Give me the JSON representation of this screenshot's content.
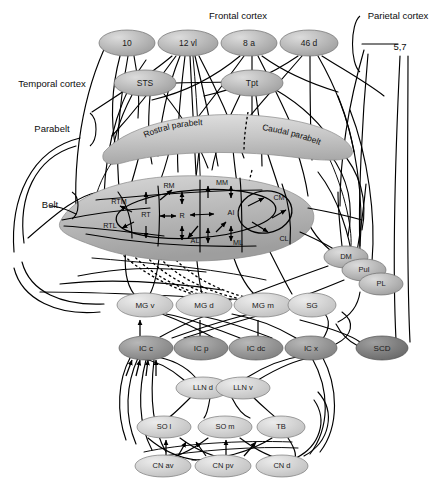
{
  "figure": {
    "type": "connectivity-diagram"
  },
  "region_labels": {
    "frontal_cortex": "Frontal cortex",
    "parietal_cortex": "Parietal cortex",
    "temporal_cortex": "Temporal cortex",
    "parabelt": "Parabelt",
    "belt": "Belt",
    "parietal_area": "5,7"
  },
  "nodes": {
    "frontal": [
      {
        "id": "a10",
        "label": "10",
        "cx": 127,
        "cy": 43,
        "rx": 28,
        "ry": 13,
        "shade": "mid"
      },
      {
        "id": "a12vl",
        "label": "12 vl",
        "cx": 188,
        "cy": 43,
        "rx": 30,
        "ry": 13,
        "shade": "mid"
      },
      {
        "id": "a8a",
        "label": "8 a",
        "cx": 249,
        "cy": 43,
        "rx": 28,
        "ry": 13,
        "shade": "mid"
      },
      {
        "id": "a46d",
        "label": "46 d",
        "cx": 309,
        "cy": 43,
        "rx": 29,
        "ry": 13,
        "shade": "mid"
      }
    ],
    "temporal": [
      {
        "id": "sts",
        "label": "STS",
        "cx": 145,
        "cy": 83,
        "rx": 31,
        "ry": 13,
        "shade": "mid"
      },
      {
        "id": "tpt",
        "label": "Tpt",
        "cx": 252,
        "cy": 83,
        "rx": 31,
        "ry": 13,
        "shade": "mid"
      }
    ],
    "parabelt": [
      {
        "id": "rostral_parabelt",
        "label": "Rostral parabelt"
      },
      {
        "id": "caudal_parabelt",
        "label": "Caudal parabelt"
      }
    ],
    "belt": [
      {
        "id": "rtm",
        "label": "RTM",
        "x": 119,
        "y": 202
      },
      {
        "id": "rtl",
        "label": "RTL",
        "x": 110,
        "y": 226
      },
      {
        "id": "rm",
        "label": "RM",
        "x": 169,
        "y": 186
      },
      {
        "id": "mm",
        "label": "MM",
        "x": 222,
        "y": 183
      },
      {
        "id": "cm",
        "label": "CM",
        "x": 279,
        "y": 198
      },
      {
        "id": "cl",
        "label": "CL",
        "x": 284,
        "y": 239
      },
      {
        "id": "al",
        "label": "AL",
        "x": 195,
        "y": 241
      },
      {
        "id": "ml",
        "label": "ML",
        "x": 238,
        "y": 243
      }
    ],
    "core": [
      {
        "id": "rt",
        "label": "RT",
        "x": 146,
        "y": 215
      },
      {
        "id": "r",
        "label": "R",
        "x": 182,
        "y": 216
      },
      {
        "id": "ai",
        "label": "AI",
        "x": 231,
        "y": 213
      }
    ],
    "thalamus_lateral": [
      {
        "id": "dm",
        "label": "DM",
        "cx": 346,
        "cy": 257,
        "rx": 22,
        "ry": 11,
        "shade": "mid"
      },
      {
        "id": "pul",
        "label": "Pul",
        "cx": 364,
        "cy": 269,
        "rx": 22,
        "ry": 11,
        "shade": "mid"
      },
      {
        "id": "pl",
        "label": "PL",
        "cx": 381,
        "cy": 283,
        "rx": 22,
        "ry": 11,
        "shade": "mid"
      }
    ],
    "mgb": [
      {
        "id": "mgv",
        "label": "MG v",
        "cx": 145,
        "cy": 305,
        "rx": 28,
        "ry": 12,
        "shade": "light"
      },
      {
        "id": "mgd",
        "label": "MG d",
        "cx": 204,
        "cy": 305,
        "rx": 28,
        "ry": 12,
        "shade": "light"
      },
      {
        "id": "mgm",
        "label": "MG m",
        "cx": 263,
        "cy": 305,
        "rx": 29,
        "ry": 12,
        "shade": "light"
      },
      {
        "id": "sg",
        "label": "SG",
        "cx": 312,
        "cy": 305,
        "rx": 24,
        "ry": 12,
        "shade": "light"
      }
    ],
    "ic": [
      {
        "id": "icc",
        "label": "IC c",
        "cx": 146,
        "cy": 348,
        "rx": 27,
        "ry": 12,
        "shade": "dark"
      },
      {
        "id": "icp",
        "label": "IC p",
        "cx": 201,
        "cy": 348,
        "rx": 27,
        "ry": 12,
        "shade": "dark"
      },
      {
        "id": "icdc",
        "label": "IC dc",
        "cx": 256,
        "cy": 348,
        "rx": 27,
        "ry": 12,
        "shade": "dark"
      },
      {
        "id": "icx",
        "label": "IC x",
        "cx": 311,
        "cy": 348,
        "rx": 26,
        "ry": 12,
        "shade": "dark"
      },
      {
        "id": "scd",
        "label": "SCD",
        "cx": 382,
        "cy": 348,
        "rx": 26,
        "ry": 12,
        "shade": "darkest"
      }
    ],
    "lln": [
      {
        "id": "llnd",
        "label": "LLN d",
        "cx": 203,
        "cy": 388,
        "rx": 27,
        "ry": 11,
        "shade": "light"
      },
      {
        "id": "llnv",
        "label": "LLN v",
        "cx": 243,
        "cy": 388,
        "rx": 27,
        "ry": 11,
        "shade": "light"
      }
    ],
    "so": [
      {
        "id": "sol",
        "label": "SO l",
        "cx": 164,
        "cy": 427,
        "rx": 27,
        "ry": 11,
        "shade": "light"
      },
      {
        "id": "som",
        "label": "SO m",
        "cx": 225,
        "cy": 427,
        "rx": 27,
        "ry": 11,
        "shade": "light"
      },
      {
        "id": "tb",
        "label": "TB",
        "cx": 281,
        "cy": 427,
        "rx": 24,
        "ry": 11,
        "shade": "light"
      }
    ],
    "cn": [
      {
        "id": "cnav",
        "label": "CN av",
        "cx": 163,
        "cy": 466,
        "rx": 28,
        "ry": 11,
        "shade": "light"
      },
      {
        "id": "cnpv",
        "label": "CN pv",
        "cx": 223,
        "cy": 466,
        "rx": 28,
        "ry": 11,
        "shade": "light"
      },
      {
        "id": "cnd",
        "label": "CN d",
        "cx": 282,
        "cy": 466,
        "rx": 26,
        "ry": 11,
        "shade": "light"
      }
    ]
  },
  "colors": {
    "node_light": "#cccccc",
    "node_mid": "#b3b3b3",
    "node_dark": "#909090",
    "node_darkest": "#777777",
    "belt_fill": "#b5b5b5",
    "parabelt_fill": "#c4c4c4",
    "stroke": "#000000",
    "background": "#ffffff"
  }
}
